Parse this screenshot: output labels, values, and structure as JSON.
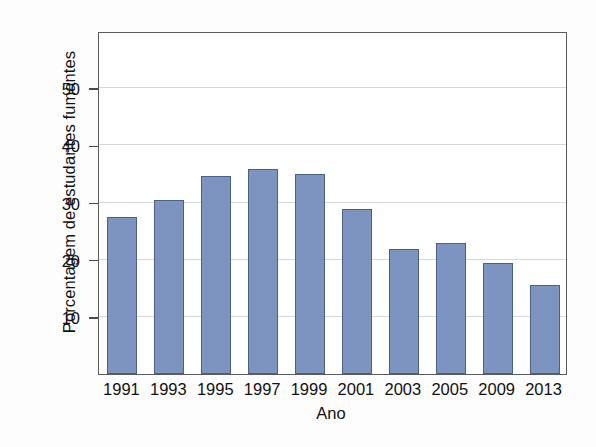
{
  "chart_data": {
    "type": "bar",
    "title": "",
    "xlabel": "Ano",
    "ylabel": "Porcentagem de estudantes fumantes",
    "categories": [
      "1991",
      "1993",
      "1995",
      "1997",
      "1999",
      "2001",
      "2003",
      "2005",
      "2009",
      "2013"
    ],
    "values": [
      27.5,
      30.5,
      34.7,
      35.8,
      35.0,
      28.8,
      21.8,
      23.0,
      19.5,
      15.6
    ],
    "ylim": [
      0,
      60
    ],
    "yticks": [
      10,
      20,
      30,
      40,
      50
    ],
    "ytick_labels": [
      "10",
      "20",
      "30",
      "40",
      "50"
    ],
    "grid": true,
    "legend": false,
    "legend_position": "none",
    "series": [
      {
        "name": "Porcentagem de estudantes fumantes",
        "values": [
          27.5,
          30.5,
          34.7,
          35.8,
          35.0,
          28.8,
          21.8,
          23.0,
          19.5,
          15.6
        ]
      }
    ]
  },
  "style": {
    "bar_fill": "#7d94c0",
    "bar_border": "#4a5f8a",
    "grid_color": "#d6d6d6",
    "frame_color": "#5a5a5a",
    "background": "#fdfdfd",
    "plot_background": "#ffffff",
    "text_color": "#111111"
  },
  "axes": {
    "x_title": "Ano",
    "y_title": "Porcentagem de estudantes fumantes"
  }
}
